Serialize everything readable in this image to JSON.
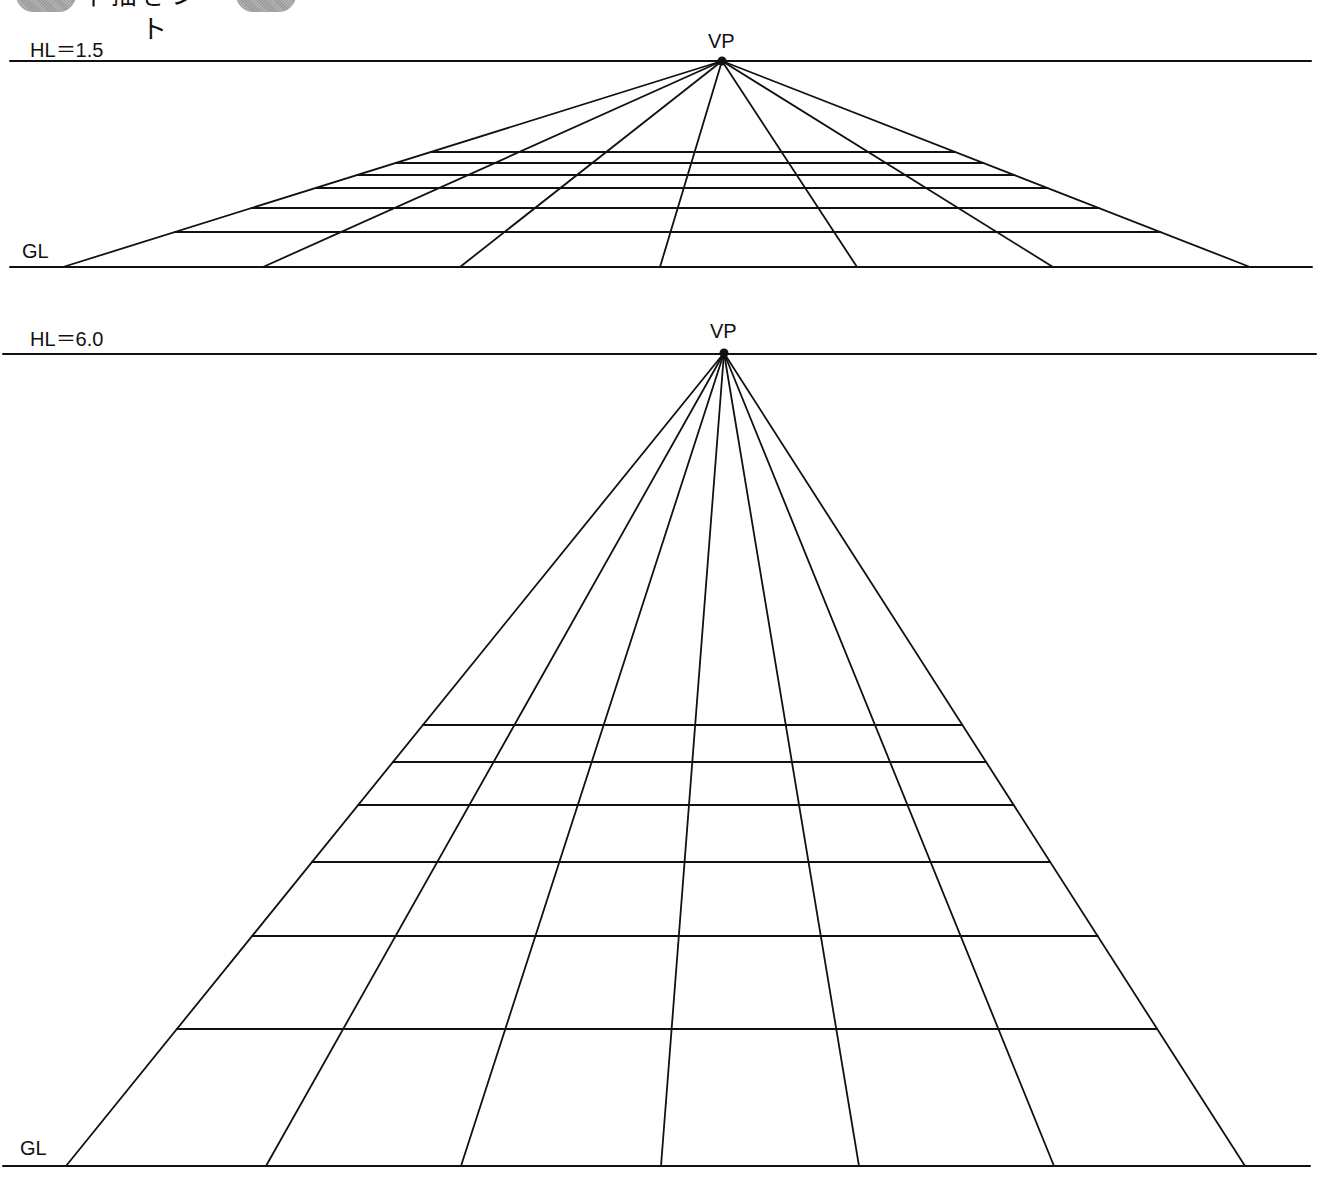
{
  "banner": {
    "title": "下描きシート"
  },
  "panels": [
    {
      "id": "hl-1.5",
      "hl_label": "HL＝1.5",
      "vp_label": "VP",
      "gl_label": "GL",
      "horizon": {
        "x1": 10,
        "x2": 1311,
        "y": 61
      },
      "vp": {
        "x": 722,
        "y": 61
      },
      "ground": {
        "x1": 10,
        "x2": 1312,
        "y": 267
      },
      "ray_feet_x": [
        63,
        263,
        460,
        660,
        857,
        1053,
        1250
      ],
      "grid_rows_y": [
        152,
        163,
        175,
        188,
        208,
        232
      ],
      "labels_pos": {
        "hl": [
          30,
          34
        ],
        "vp": [
          708,
          30
        ],
        "gl": [
          22,
          240
        ]
      }
    },
    {
      "id": "hl-6.0",
      "hl_label": "HL＝6.0",
      "vp_label": "VP",
      "gl_label": "GL",
      "horizon": {
        "x1": 3,
        "x2": 1316,
        "y": 354
      },
      "vp": {
        "x": 724,
        "y": 353
      },
      "ground": {
        "x1": 3,
        "x2": 1310,
        "y": 1166
      },
      "ray_feet_x": [
        66,
        266,
        461,
        661,
        859,
        1054,
        1245
      ],
      "grid_rows_y": [
        725,
        762,
        805,
        862,
        936,
        1029
      ],
      "labels_pos": {
        "hl": [
          30,
          323
        ],
        "vp": [
          710,
          320
        ],
        "gl": [
          20,
          1137
        ]
      }
    }
  ]
}
